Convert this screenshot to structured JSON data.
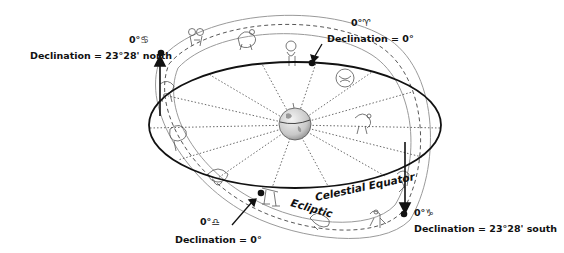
{
  "diagram": {
    "type": "celestial-sphere-ecliptic",
    "curves": {
      "celestial_equator": "Celestial Equator",
      "ecliptic": "Ecliptic"
    },
    "center_object": "Earth",
    "points": [
      {
        "id": "summer-solstice",
        "sign_label": "0°♋",
        "declination_label": "Declination = 23°28' north"
      },
      {
        "id": "vernal-equinox",
        "sign_label": "0°♈",
        "declination_label": "Declination = 0°"
      },
      {
        "id": "autumnal-equinox",
        "sign_label": "0°♎",
        "declination_label": "Declination = 0°"
      },
      {
        "id": "winter-solstice",
        "sign_label": "0°♑",
        "declination_label": "Declination = 23°28' south"
      }
    ],
    "colors": {
      "ink": "#111111",
      "band": "#9a9a9a",
      "dotted": "#444444",
      "earth": "#d0d0d0"
    }
  }
}
